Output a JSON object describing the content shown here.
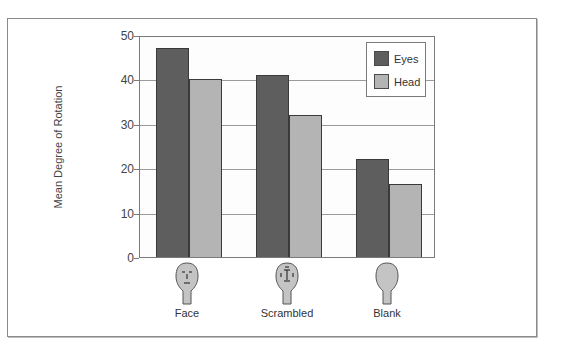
{
  "chart_data": {
    "type": "bar",
    "title": "",
    "xlabel": "",
    "ylabel": "Mean Degree of Rotation",
    "ylim": [
      0,
      50
    ],
    "yticks": [
      "0",
      "10",
      "20",
      "30",
      "40",
      "50"
    ],
    "grid": true,
    "legend_position": "upper right (inside plot)",
    "categories": [
      "Face",
      "Scrambled",
      "Blank"
    ],
    "series": [
      {
        "name": "Eyes",
        "color": "#5e5e5e",
        "values": [
          47,
          41,
          22
        ]
      },
      {
        "name": "Head",
        "color": "#b4b4b4",
        "values": [
          40,
          32,
          16.5
        ]
      }
    ],
    "category_icons": [
      "face-with-features-icon",
      "scrambled-face-icon",
      "blank-head-icon"
    ]
  },
  "axis": {
    "ylabel": "Mean Degree of Rotation",
    "ticks": [
      "0",
      "10",
      "20",
      "30",
      "40",
      "50"
    ]
  },
  "legend": {
    "items": [
      {
        "label": "Eyes",
        "color": "#5e5e5e"
      },
      {
        "label": "Head",
        "color": "#b4b4b4"
      }
    ]
  },
  "categories": [
    {
      "label": "Face",
      "icon": "face-with-features-icon"
    },
    {
      "label": "Scrambled",
      "icon": "scrambled-face-icon"
    },
    {
      "label": "Blank",
      "icon": "blank-head-icon"
    }
  ]
}
